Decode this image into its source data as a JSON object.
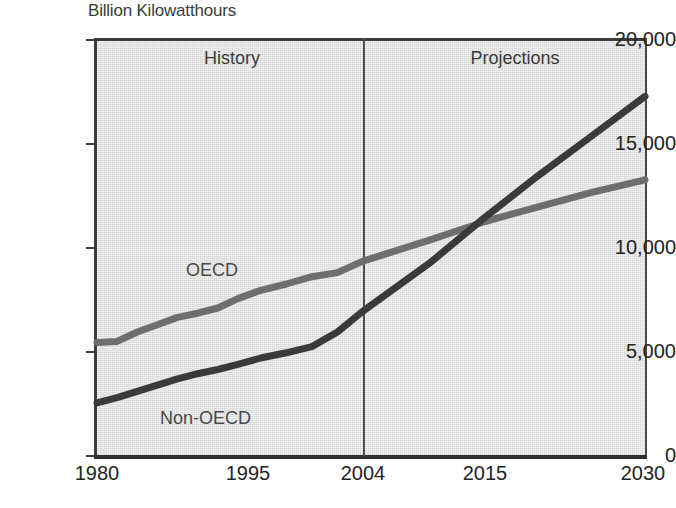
{
  "chart_data": {
    "type": "line",
    "title": "Billion Kilowatthours",
    "subtitle": "",
    "xlabel": "",
    "ylabel": "Billion Kilowatthours",
    "grid": false,
    "legend_position": "inline-labels",
    "xlim": [
      1980,
      2030
    ],
    "ylim": [
      0,
      20000
    ],
    "x_tick_labels": [
      "1980",
      "1995",
      "2004",
      "2015",
      "2030"
    ],
    "x_ticks": [
      1980,
      1995,
      2004,
      2015,
      2030
    ],
    "y_tick_labels": [
      "0",
      "5,000",
      "10,000",
      "15,000",
      "20,000"
    ],
    "y_ticks": [
      0,
      5000,
      10000,
      15000,
      20000
    ],
    "annotations": [
      {
        "text": "History",
        "region": "left-of-divider"
      },
      {
        "text": "Projections",
        "region": "right-of-divider"
      }
    ],
    "divider": {
      "x": 2004,
      "label_left": "History",
      "label_right": "Projections"
    },
    "series": [
      {
        "name": "OECD",
        "color": "#6e6e6e",
        "x": [
          1980,
          1982,
          1984,
          1986,
          1988,
          1990,
          1992,
          1994,
          1996,
          1998,
          2000,
          2002,
          2004,
          2010,
          2015,
          2020,
          2025,
          2030
        ],
        "values": [
          5400,
          5450,
          5900,
          6250,
          6600,
          6800,
          7050,
          7500,
          7900,
          8200,
          8550,
          8750,
          9300,
          10300,
          11200,
          11900,
          12600,
          13200
        ]
      },
      {
        "name": "Non-OECD",
        "color": "#3a3a3a",
        "x": [
          1980,
          1982,
          1984,
          1986,
          1988,
          1990,
          1992,
          1994,
          1996,
          1998,
          2000,
          2002,
          2004,
          2010,
          2015,
          2020,
          2025,
          2030
        ],
        "values": [
          2500,
          2750,
          3050,
          3350,
          3650,
          3900,
          4100,
          4350,
          4650,
          4900,
          5200,
          5900,
          6900,
          9200,
          11400,
          13400,
          15300,
          17200
        ]
      }
    ]
  },
  "title": {
    "text": "Billion Kilowatthours"
  },
  "panels": {
    "history": "History",
    "projections": "Projections"
  },
  "series_labels": {
    "oecd": "OECD",
    "non_oecd": "Non-OECD"
  },
  "y_axis": {
    "labels": [
      "20,000",
      "15,000",
      "10,000",
      "5,000",
      "0"
    ]
  },
  "x_axis": {
    "labels": [
      "1980",
      "1995",
      "2004",
      "2015",
      "2030"
    ]
  },
  "colors": {
    "oecd_line": "#6e6e6e",
    "non_oecd_line": "#3a3a3a",
    "plot_background": "#e2e2e2",
    "axis": "#3c3c3c",
    "page_background": "#ffffff"
  }
}
